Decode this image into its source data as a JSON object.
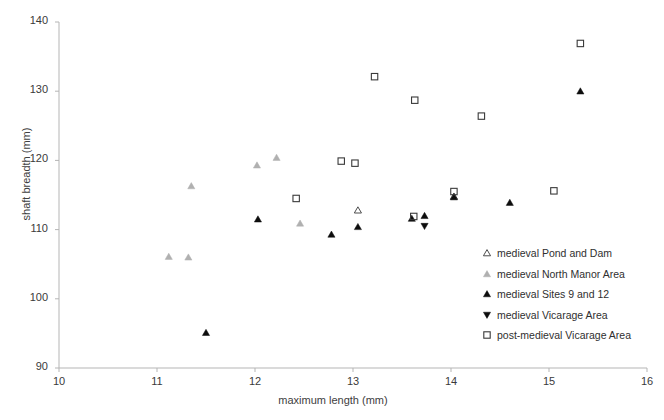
{
  "chart_data": {
    "type": "scatter",
    "title": "",
    "xlabel": "maximum length (mm)",
    "ylabel": "shaft breadth (mm)",
    "xlim": [
      10,
      16
    ],
    "ylim": [
      90,
      140
    ],
    "xticks": [
      10,
      11,
      12,
      13,
      14,
      15,
      16
    ],
    "yticks": [
      90,
      100,
      110,
      120,
      130,
      140
    ],
    "grid": false,
    "legend_position": "inside-lower-right",
    "series": [
      {
        "name": "medieval Pond and Dam",
        "marker": "triangle-open",
        "color": "#4d4d4d",
        "points": [
          {
            "x": 13.05,
            "y": 112.8
          },
          {
            "x": 14.03,
            "y": 114.8
          }
        ]
      },
      {
        "name": "medieval North Manor Area",
        "marker": "triangle-filled",
        "color": "#b0b0b0",
        "points": [
          {
            "x": 11.12,
            "y": 106.1
          },
          {
            "x": 11.32,
            "y": 106.0
          },
          {
            "x": 11.35,
            "y": 116.3
          },
          {
            "x": 12.02,
            "y": 119.3
          },
          {
            "x": 12.22,
            "y": 120.4
          },
          {
            "x": 12.46,
            "y": 110.9
          }
        ]
      },
      {
        "name": "medieval Sites 9 and 12",
        "marker": "triangle-filled",
        "color": "#0d0d0d",
        "points": [
          {
            "x": 11.5,
            "y": 95.1
          },
          {
            "x": 12.03,
            "y": 111.5
          },
          {
            "x": 12.78,
            "y": 109.3
          },
          {
            "x": 13.05,
            "y": 110.4
          },
          {
            "x": 13.6,
            "y": 111.6
          },
          {
            "x": 13.73,
            "y": 112.0
          },
          {
            "x": 14.03,
            "y": 114.7
          },
          {
            "x": 14.6,
            "y": 113.9
          },
          {
            "x": 15.32,
            "y": 130.0
          }
        ]
      },
      {
        "name": "medieval Vicarage Area",
        "marker": "triangle-down-filled",
        "color": "#0d0d0d",
        "points": [
          {
            "x": 13.73,
            "y": 110.5
          }
        ]
      },
      {
        "name": "post-medieval Vicarage Area",
        "marker": "square-open",
        "color": "#3a3a3a",
        "points": [
          {
            "x": 12.42,
            "y": 114.5
          },
          {
            "x": 12.88,
            "y": 119.9
          },
          {
            "x": 13.02,
            "y": 119.6
          },
          {
            "x": 13.22,
            "y": 132.1
          },
          {
            "x": 13.63,
            "y": 128.7
          },
          {
            "x": 13.62,
            "y": 111.9
          },
          {
            "x": 14.03,
            "y": 115.5
          },
          {
            "x": 14.31,
            "y": 126.4
          },
          {
            "x": 15.05,
            "y": 115.6
          },
          {
            "x": 15.32,
            "y": 136.9
          }
        ]
      }
    ]
  },
  "legend": {
    "items": [
      {
        "label": "medieval Pond and Dam",
        "marker": "triangle-open-icon"
      },
      {
        "label": "medieval North Manor Area",
        "marker": "triangle-gray-icon"
      },
      {
        "label": "medieval Sites 9 and 12",
        "marker": "triangle-black-icon"
      },
      {
        "label": "medieval Vicarage Area",
        "marker": "triangle-down-black-icon"
      },
      {
        "label": "post-medieval Vicarage Area",
        "marker": "square-open-icon"
      }
    ]
  },
  "colors": {
    "axis": "#b5b5b5",
    "text": "#3a3a3a",
    "gray_marker": "#b0b0b0",
    "black_marker": "#0d0d0d",
    "open_marker": "#3a3a3a"
  }
}
